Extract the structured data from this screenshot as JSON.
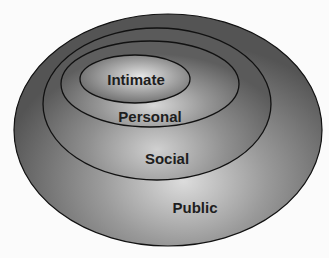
{
  "diagram": {
    "type": "nested-ellipses",
    "zones": [
      {
        "id": "public",
        "label": "Public",
        "order": 4
      },
      {
        "id": "social",
        "label": "Social",
        "order": 3
      },
      {
        "id": "personal",
        "label": "Personal",
        "order": 2
      },
      {
        "id": "intimate",
        "label": "Intimate",
        "order": 1
      }
    ],
    "colors": {
      "fill_dark": "#5a5a5a",
      "fill_light": "#d8d8d8",
      "stroke": "#111111",
      "background": "#fbfbfb"
    }
  }
}
